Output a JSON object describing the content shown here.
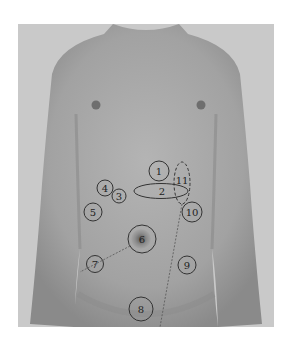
{
  "figure": {
    "background_color": "#ffffff",
    "photo_bg_color": "#c9c9c9",
    "skin_color": "#a8a8a8",
    "annotation_color": "#333333",
    "markers": [
      {
        "id": "1",
        "label": "1",
        "shape": "circle"
      },
      {
        "id": "2",
        "label": "2",
        "shape": "ellipse"
      },
      {
        "id": "3",
        "label": "3",
        "shape": "circle"
      },
      {
        "id": "4",
        "label": "4",
        "shape": "circle"
      },
      {
        "id": "5",
        "label": "5",
        "shape": "circle"
      },
      {
        "id": "6",
        "label": "6",
        "shape": "circle"
      },
      {
        "id": "7",
        "label": "7",
        "shape": "circle"
      },
      {
        "id": "8",
        "label": "8",
        "shape": "circle"
      },
      {
        "id": "9",
        "label": "9",
        "shape": "circle"
      },
      {
        "id": "10",
        "label": "10",
        "shape": "circle"
      },
      {
        "id": "11",
        "label": "11",
        "shape": "dashed-ellipse"
      }
    ]
  }
}
